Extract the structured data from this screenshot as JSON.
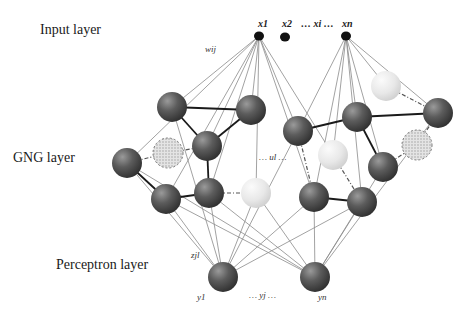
{
  "layers": {
    "input": {
      "label": "Input layer",
      "x": 40,
      "y": 22
    },
    "gng": {
      "label": "GNG layer",
      "x": 13,
      "y": 150
    },
    "perceptron": {
      "label": "Perceptron layer",
      "x": 56,
      "y": 257
    }
  },
  "variable_labels": {
    "x1": "x1",
    "x2": "x2",
    "xi": "… xi …",
    "xn": "xn",
    "wij": "wij",
    "ul": "… ul …",
    "zjl": "zjl",
    "y1": "y1",
    "yj": "… yj …",
    "yn": "yn"
  },
  "colors": {
    "active_node": "#5a5a5a",
    "light_node": "#e6e6e6",
    "removed_node": "#d4d4d4",
    "weight_line": "#8a8a8a",
    "edge_line": "#1a1a1a",
    "input_node": "#111111"
  },
  "input_nodes": [
    {
      "id": "x1",
      "x": 259,
      "y": 36
    },
    {
      "id": "x2",
      "x": 285,
      "y": 37
    },
    {
      "id": "xn",
      "x": 346,
      "y": 36
    }
  ],
  "gng_nodes": [
    {
      "id": "A",
      "x": 172,
      "y": 107,
      "type": "active"
    },
    {
      "id": "B",
      "x": 251,
      "y": 110,
      "type": "active"
    },
    {
      "id": "C",
      "x": 207,
      "y": 146,
      "type": "active"
    },
    {
      "id": "D",
      "x": 127,
      "y": 163,
      "type": "active"
    },
    {
      "id": "E",
      "x": 168,
      "y": 153,
      "type": "removed"
    },
    {
      "id": "F",
      "x": 166,
      "y": 199,
      "type": "active"
    },
    {
      "id": "G",
      "x": 209,
      "y": 193,
      "type": "active"
    },
    {
      "id": "H",
      "x": 256,
      "y": 193,
      "type": "light"
    },
    {
      "id": "I",
      "x": 298,
      "y": 131,
      "type": "active"
    },
    {
      "id": "J",
      "x": 357,
      "y": 117,
      "type": "active"
    },
    {
      "id": "K",
      "x": 386,
      "y": 86,
      "type": "light"
    },
    {
      "id": "L",
      "x": 438,
      "y": 113,
      "type": "active"
    },
    {
      "id": "M",
      "x": 333,
      "y": 155,
      "type": "light"
    },
    {
      "id": "N",
      "x": 383,
      "y": 167,
      "type": "active"
    },
    {
      "id": "O",
      "x": 417,
      "y": 145,
      "type": "removed"
    },
    {
      "id": "P",
      "x": 314,
      "y": 197,
      "type": "active"
    },
    {
      "id": "Q",
      "x": 362,
      "y": 202,
      "type": "active"
    }
  ],
  "output_nodes": [
    {
      "id": "y1",
      "x": 223,
      "y": 277
    },
    {
      "id": "yn",
      "x": 315,
      "y": 277
    }
  ],
  "gng_edges_solid": [
    [
      "A",
      "B"
    ],
    [
      "A",
      "C"
    ],
    [
      "B",
      "C"
    ],
    [
      "C",
      "G"
    ],
    [
      "D",
      "F"
    ],
    [
      "F",
      "G"
    ],
    [
      "I",
      "J"
    ],
    [
      "J",
      "L"
    ],
    [
      "J",
      "N"
    ],
    [
      "P",
      "Q"
    ]
  ],
  "gng_edges_dashed": [
    [
      "D",
      "E"
    ],
    [
      "E",
      "C"
    ],
    [
      "G",
      "H"
    ],
    [
      "K",
      "L"
    ],
    [
      "I",
      "P"
    ],
    [
      "M",
      "Q"
    ],
    [
      "N",
      "O"
    ],
    [
      "O",
      "L"
    ]
  ],
  "input_to_gng": {
    "x1": [
      "A",
      "B",
      "C",
      "D",
      "F",
      "G",
      "H",
      "I",
      "M",
      "P"
    ],
    "xn": [
      "I",
      "J",
      "K",
      "L",
      "N",
      "P",
      "Q",
      "M"
    ]
  },
  "gng_to_output": {
    "y1": [
      "A",
      "D",
      "F",
      "G",
      "H",
      "I",
      "P",
      "Q"
    ],
    "yn": [
      "D",
      "F",
      "G",
      "H",
      "P",
      "Q",
      "N",
      "L"
    ]
  }
}
